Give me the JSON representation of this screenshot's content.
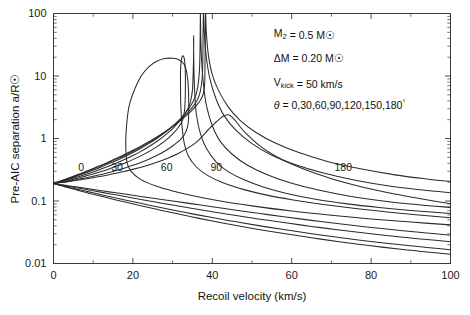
{
  "chart_data": {
    "type": "line",
    "title": "",
    "xlabel": "Recoil velocity (km/s)",
    "ylabel": "Pre-AIC separation a/R☉",
    "xlim": [
      0,
      100
    ],
    "ylim": [
      0.01,
      100
    ],
    "yscale": "log",
    "xscale": "linear",
    "grid": false,
    "legend_position": "inline-curve-labels",
    "xticks": [
      0,
      20,
      40,
      60,
      80,
      100
    ],
    "xtick_labels": [
      "0",
      "20",
      "40",
      "60",
      "80",
      "100"
    ],
    "xminor_step": 10,
    "yticks": [
      0.01,
      0.1,
      1,
      10,
      100
    ],
    "ytick_labels": [
      "0.01",
      "0.1",
      "1",
      "10",
      "100"
    ],
    "series": [
      {
        "name": "0",
        "label": "0",
        "theta_deg": 0,
        "label_x": 7.0,
        "label_y": 0.34,
        "x": [
          0,
          2,
          4,
          6,
          8,
          10,
          12,
          14,
          16,
          18,
          20,
          24,
          28,
          32,
          36,
          40,
          44,
          48,
          52,
          56,
          60,
          65,
          70,
          75,
          80,
          85,
          90,
          95,
          100
        ],
        "y": [
          0.19,
          0.197,
          0.206,
          0.215,
          0.225,
          0.236,
          0.249,
          0.263,
          0.28,
          0.299,
          0.321,
          0.378,
          0.463,
          0.603,
          0.872,
          1.6,
          2.4,
          1.3,
          0.76,
          0.52,
          0.39,
          0.29,
          0.228,
          0.186,
          0.156,
          0.133,
          0.116,
          0.102,
          0.091
        ]
      },
      {
        "name": "30",
        "label": "30",
        "theta_deg": 30,
        "label_x": 16.0,
        "label_y": 0.34,
        "x": [
          0,
          2,
          4,
          6,
          8,
          10,
          12,
          14,
          16,
          18,
          20,
          22,
          24,
          26,
          28,
          30,
          31,
          32,
          33,
          33.6,
          34,
          34,
          33.6,
          33,
          32,
          31,
          30,
          28,
          26,
          24,
          22,
          20,
          19,
          18.4,
          18.2,
          18.5,
          19.5,
          22,
          26,
          30,
          36,
          42,
          50,
          60,
          70,
          80,
          90,
          100
        ],
        "y": [
          0.19,
          0.199,
          0.209,
          0.221,
          0.234,
          0.249,
          0.266,
          0.286,
          0.31,
          0.338,
          0.372,
          0.414,
          0.466,
          0.534,
          0.626,
          0.76,
          0.85,
          0.97,
          1.16,
          1.42,
          2.0,
          6.0,
          11.0,
          15.0,
          17.5,
          18.8,
          19.3,
          19.0,
          17.2,
          14.0,
          9.8,
          5.2,
          3.2,
          1.6,
          0.8,
          0.42,
          0.3,
          0.22,
          0.172,
          0.145,
          0.118,
          0.1,
          0.0836,
          0.069,
          0.059,
          0.0516,
          0.046,
          0.0415
        ]
      },
      {
        "name": "60",
        "label": "60",
        "theta_deg": 60,
        "label_x": 28.5,
        "label_y": 0.34,
        "x": [
          0,
          2,
          4,
          6,
          8,
          10,
          12,
          14,
          16,
          18,
          20,
          22,
          24,
          26,
          28,
          30,
          31,
          32,
          32.6,
          33,
          33.2,
          33.2,
          33,
          32.6,
          32.2,
          32.0,
          32.0,
          32.1,
          32.4,
          33.0,
          34,
          36,
          39,
          43,
          48,
          54,
          60,
          68,
          76,
          84,
          92,
          100
        ],
        "y": [
          0.19,
          0.202,
          0.215,
          0.231,
          0.25,
          0.271,
          0.296,
          0.326,
          0.362,
          0.405,
          0.459,
          0.527,
          0.616,
          0.736,
          0.908,
          1.18,
          1.38,
          1.7,
          2.05,
          2.8,
          5.0,
          12.0,
          18.0,
          21.0,
          18.0,
          12.0,
          6.0,
          3.0,
          1.5,
          0.8,
          0.52,
          0.35,
          0.252,
          0.192,
          0.152,
          0.123,
          0.105,
          0.088,
          0.076,
          0.0668,
          0.0598,
          0.054
        ]
      },
      {
        "name": "90",
        "label": "90",
        "theta_deg": 90,
        "label_x": 41.0,
        "label_y": 0.34,
        "x": [
          0,
          2,
          4,
          6,
          8,
          10,
          12,
          14,
          16,
          18,
          20,
          22,
          24,
          26,
          28,
          30,
          32,
          33,
          34,
          34.6,
          35,
          35.2,
          35.3,
          35.3,
          35.3,
          35.4,
          35.6,
          36,
          37,
          38.5,
          41,
          44,
          48,
          53,
          59,
          66,
          74,
          82,
          90,
          100
        ],
        "y": [
          0.19,
          0.205,
          0.222,
          0.242,
          0.265,
          0.292,
          0.324,
          0.362,
          0.408,
          0.464,
          0.534,
          0.622,
          0.738,
          0.894,
          1.11,
          1.44,
          1.98,
          2.42,
          3.15,
          4.1,
          6.0,
          12.0,
          25.0,
          44.0,
          25.0,
          11.0,
          5.0,
          2.4,
          1.2,
          0.7,
          0.42,
          0.295,
          0.218,
          0.166,
          0.131,
          0.107,
          0.09,
          0.0788,
          0.0706,
          0.063
        ]
      },
      {
        "name": "120",
        "label": "",
        "theta_deg": 120,
        "label_x": null,
        "label_y": null,
        "x": [
          0,
          2,
          4,
          6,
          8,
          10,
          12,
          14,
          16,
          18,
          20,
          22,
          24,
          26,
          28,
          30,
          32,
          33,
          34,
          35,
          35.8,
          36.3,
          36.6,
          36.8,
          36.9,
          36.95,
          37.0,
          37.1,
          37.3,
          37.8,
          38.6,
          40,
          42,
          45,
          49,
          54,
          60,
          67,
          75,
          84,
          92,
          100
        ],
        "y": [
          0.19,
          0.208,
          0.229,
          0.253,
          0.281,
          0.313,
          0.351,
          0.396,
          0.45,
          0.516,
          0.597,
          0.698,
          0.828,
          1.0,
          1.23,
          1.57,
          2.09,
          2.47,
          2.98,
          3.72,
          4.8,
          6.5,
          9.0,
          14.0,
          24.0,
          45.0,
          100,
          42.0,
          18.0,
          7.0,
          3.2,
          1.6,
          0.9,
          0.56,
          0.37,
          0.26,
          0.192,
          0.148,
          0.118,
          0.098,
          0.087,
          0.079
        ]
      },
      {
        "name": "150",
        "label": "",
        "theta_deg": 150,
        "label_x": null,
        "label_y": null,
        "x": [
          0,
          2,
          4,
          6,
          8,
          10,
          12,
          14,
          16,
          18,
          20,
          22,
          24,
          26,
          28,
          30,
          32,
          33,
          34,
          35,
          36,
          36.6,
          37.0,
          37.3,
          37.5,
          37.6,
          37.65,
          37.7,
          37.8,
          38.0,
          38.5,
          39.4,
          41,
          43,
          46,
          50,
          55,
          61,
          68,
          76,
          85,
          93,
          100
        ],
        "y": [
          0.19,
          0.21,
          0.233,
          0.259,
          0.29,
          0.325,
          0.366,
          0.414,
          0.472,
          0.541,
          0.625,
          0.729,
          0.86,
          1.03,
          1.25,
          1.56,
          2.0,
          2.3,
          2.68,
          3.18,
          3.9,
          4.7,
          5.8,
          7.6,
          10.5,
          16.0,
          28.0,
          60.0,
          100,
          46.0,
          20.0,
          9.0,
          4.2,
          2.3,
          1.35,
          0.83,
          0.54,
          0.38,
          0.28,
          0.215,
          0.172,
          0.15,
          0.136
        ]
      },
      {
        "name": "180",
        "label": "180",
        "theta_deg": 180,
        "label_x": 73.0,
        "label_y": 0.34,
        "x": [
          0,
          2,
          4,
          6,
          8,
          10,
          12,
          14,
          16,
          18,
          20,
          22,
          24,
          26,
          28,
          30,
          32,
          33,
          34,
          35,
          36,
          37,
          37.5,
          37.8,
          38.0,
          38.1,
          38.15,
          38.2,
          38.3,
          38.5,
          39,
          40,
          41.5,
          44,
          47,
          51,
          56,
          62,
          69,
          77,
          86,
          94,
          100
        ],
        "y": [
          0.19,
          0.211,
          0.235,
          0.263,
          0.295,
          0.332,
          0.375,
          0.426,
          0.487,
          0.559,
          0.647,
          0.754,
          0.888,
          1.06,
          1.27,
          1.56,
          1.95,
          2.2,
          2.5,
          2.88,
          3.38,
          4.1,
          4.7,
          5.4,
          6.4,
          8.2,
          13.0,
          30.0,
          100,
          50.0,
          22.0,
          10.5,
          6.0,
          3.2,
          1.95,
          1.25,
          0.84,
          0.59,
          0.43,
          0.33,
          0.262,
          0.225,
          0.205
        ]
      },
      {
        "name": "0-lower",
        "label": "",
        "theta_deg": 0,
        "branch": "lower",
        "label_x": null,
        "label_y": null,
        "x": [
          0,
          2,
          4,
          6,
          8,
          10,
          14,
          18,
          22,
          26,
          30,
          35,
          40,
          46,
          52,
          58,
          65,
          72,
          80,
          88,
          94,
          100
        ],
        "y": [
          0.19,
          0.182,
          0.174,
          0.167,
          0.16,
          0.153,
          0.14,
          0.129,
          0.118,
          0.109,
          0.1,
          0.09,
          0.081,
          0.0712,
          0.063,
          0.056,
          0.049,
          0.0432,
          0.0378,
          0.0335,
          0.0308,
          0.0284
        ]
      },
      {
        "name": "30-lower",
        "label": "",
        "theta_deg": 30,
        "branch": "lower",
        "label_x": null,
        "label_y": null,
        "x": [
          0,
          2,
          4,
          6,
          8,
          10,
          14,
          18,
          22,
          26,
          30,
          35,
          40,
          46,
          52,
          58,
          65,
          72,
          80,
          88,
          94,
          100
        ],
        "y": [
          0.19,
          0.18,
          0.171,
          0.162,
          0.154,
          0.146,
          0.131,
          0.118,
          0.106,
          0.0955,
          0.0862,
          0.076,
          0.0675,
          0.0585,
          0.0512,
          0.0452,
          0.0392,
          0.0344,
          0.0299,
          0.0263,
          0.0242,
          0.0223
        ]
      },
      {
        "name": "60-lower",
        "label": "",
        "theta_deg": 60,
        "branch": "lower",
        "label_x": null,
        "label_y": null,
        "x": [
          0,
          2,
          4,
          6,
          8,
          10,
          14,
          18,
          22,
          26,
          30,
          35,
          40,
          46,
          52,
          58,
          65,
          72,
          80,
          88,
          94,
          100
        ],
        "y": [
          0.19,
          0.177,
          0.165,
          0.154,
          0.144,
          0.135,
          0.118,
          0.104,
          0.0918,
          0.0812,
          0.072,
          0.0622,
          0.0543,
          0.0464,
          0.04,
          0.0349,
          0.03,
          0.0261,
          0.0225,
          0.0197,
          0.0181,
          0.0166
        ]
      },
      {
        "name": "90-lower",
        "label": "",
        "theta_deg": 90,
        "branch": "lower",
        "label_x": null,
        "label_y": null,
        "x": [
          0,
          2,
          4,
          6,
          8,
          10,
          14,
          18,
          22,
          26,
          30,
          35,
          40,
          46,
          52,
          58,
          65,
          72,
          80,
          88,
          94,
          100
        ],
        "y": [
          0.19,
          0.175,
          0.161,
          0.149,
          0.138,
          0.128,
          0.111,
          0.096,
          0.0838,
          0.0735,
          0.0648,
          0.0554,
          0.048,
          0.0406,
          0.0348,
          0.0302,
          0.0258,
          0.0223,
          0.0192,
          0.0167,
          0.0153,
          0.0141
        ]
      }
    ],
    "annotations": [
      {
        "id": "m2",
        "text": "M₂ = 0.5 M☉",
        "x": 55.5,
        "y": 42.0
      },
      {
        "id": "dm",
        "text": "ΔM = 0.20 M☉",
        "x": 55.5,
        "y": 17.0
      },
      {
        "id": "vkick",
        "text": "V_kick = 50 km/s",
        "x": 55.5,
        "y": 7.0
      },
      {
        "id": "theta",
        "text": "θ = 0,30,60,90,120,150,180°",
        "x": 55.5,
        "y": 3.0
      }
    ]
  },
  "annotation_text": {
    "m2_symbol": "M",
    "m2_sub": "2",
    "m2_value": " = 0.5 M",
    "m2_sunsym": "☉",
    "dm_symbol": "ΔM",
    "dm_value": " = 0.20 M",
    "dm_sunsym": "☉",
    "vk_symbol": "V",
    "vk_sub": "kick",
    "vk_value": " = 50 km/s",
    "theta_symbol": "θ",
    "theta_value": " = 0,30,60,90,120,150,180",
    "theta_deg": "°"
  },
  "axis_titles": {
    "x": "Recoil velocity (km/s)",
    "y_prefix": "Pre-AIC separation a/R",
    "y_sunsym": "☉"
  },
  "colors": {
    "curve": "#2b2b2b",
    "axis": "#3a3a3a",
    "text": "#111111",
    "background": "#ffffff"
  }
}
